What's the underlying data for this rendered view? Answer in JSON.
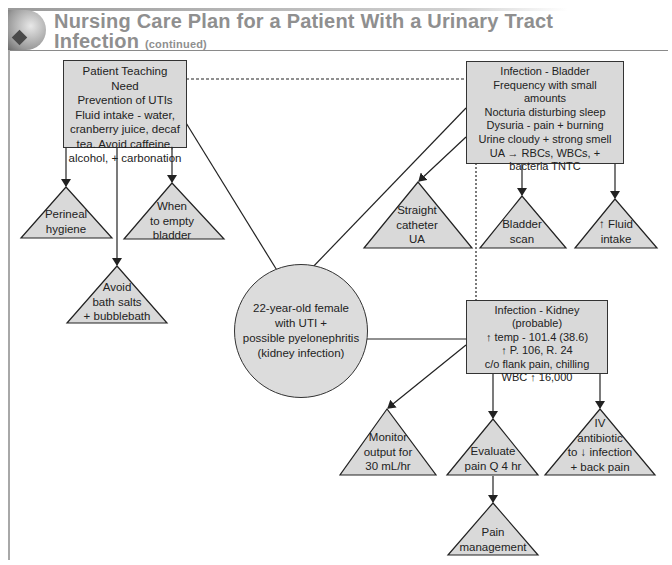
{
  "header": {
    "title_main": "Nursing Care Plan for a Patient With a Urinary Tract",
    "title_line2": "Infection",
    "title_suffix": "(continued)",
    "logo_icon": "nursing-care-plan-logo-icon"
  },
  "colors": {
    "node_fill": "#d9d9d9",
    "circle_fill": "#dcdcdc",
    "line": "#222222",
    "title": "#8f8f8f"
  },
  "center_node": {
    "lines": [
      "22-year-old female",
      "with UTI +",
      "possible pyelonephritis",
      "(kidney infection)"
    ]
  },
  "teaching_box": {
    "lines": [
      "Patient Teaching Need",
      "Prevention of UTIs",
      "Fluid intake - water,",
      "cranberry juice, decaf",
      "tea.  Avoid caffeine,",
      "alcohol, + carbonation"
    ],
    "interventions": [
      {
        "lines": [
          "Perineal",
          "hygiene"
        ]
      },
      {
        "lines": [
          "Avoid",
          "bath salts",
          "+ bubblebath"
        ]
      },
      {
        "lines": [
          "When",
          "to empty",
          "bladder"
        ]
      }
    ]
  },
  "bladder_box": {
    "lines": [
      "Infection - Bladder",
      "Frequency with small amounts",
      "Nocturia disturbing sleep",
      "Dysuria - pain + burning",
      "Urine cloudy + strong smell",
      "UA → RBCs, WBCs, +",
      "bacteria TNTC"
    ],
    "interventions": [
      {
        "lines": [
          "Straight",
          "catheter",
          "UA"
        ]
      },
      {
        "lines": [
          "Bladder",
          "scan"
        ]
      },
      {
        "lines": [
          "↑ Fluid",
          "intake"
        ]
      }
    ]
  },
  "kidney_box": {
    "lines": [
      "Infection - Kidney (probable)",
      "↑ temp - 101.4 (38.6)",
      "↑ P. 106, R. 24",
      "c/o flank pain, chilling",
      "WBC ↑ 16,000"
    ],
    "interventions": [
      {
        "lines": [
          "Monitor",
          "output for",
          "30 mL/hr"
        ]
      },
      {
        "lines": [
          "Evaluate",
          "pain Q 4 hr"
        ]
      },
      {
        "lines": [
          "IV",
          "antibiotic",
          "to ↓ infection",
          "+ back pain"
        ]
      }
    ],
    "follow_up": {
      "lines": [
        "Pain",
        "management"
      ]
    }
  }
}
